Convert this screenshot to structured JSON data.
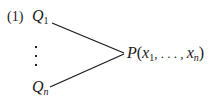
{
  "equation_number": "(1)",
  "sources": [
    {
      "symbol": "Q",
      "subscript": "1",
      "subscript_italic": false
    },
    {
      "symbol": "Q",
      "subscript": "n",
      "subscript_italic": true
    }
  ],
  "ellipsis": "vertical-dots",
  "target": {
    "function": "P",
    "open": "(",
    "arg1": "x",
    "arg1_sub": "1",
    "separator": ", . . . , ",
    "argn": "x",
    "argn_sub": "n",
    "close": ")"
  },
  "colors": {
    "ink": "#1a1a1a",
    "background": "#ffffff"
  }
}
